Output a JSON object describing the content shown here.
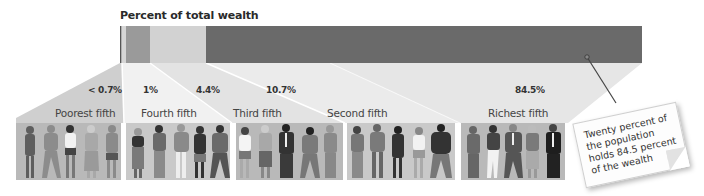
{
  "title": "Percent of total wealth",
  "bar": {
    "segments": [
      {
        "group": "Poorest fifth",
        "share": "< 0.7%",
        "color": "#d6d6d6"
      },
      {
        "group": "Fourth fifth",
        "share": "1%",
        "color": "#9a9a9a"
      },
      {
        "group": "Third fifth",
        "share": "4.4%",
        "color": "#d2d2d2"
      },
      {
        "group": "Second fifth",
        "share": "10.7%",
        "color": "#6a6a6a"
      },
      {
        "group": "Richest fifth",
        "share": "84.5%",
        "color": "#6a6a6a"
      }
    ]
  },
  "percentages": [
    "< 0.7%",
    "1%",
    "4.4%",
    "10.7%",
    "84.5%"
  ],
  "groups": [
    {
      "label": "Poorest fifth"
    },
    {
      "label": "Fourth fifth"
    },
    {
      "label": "Third fifth"
    },
    {
      "label": "Second fifth"
    },
    {
      "label": "Richest fifth"
    }
  ],
  "callout": {
    "text": "Twenty percent of the population holds 84.5 percent of the wealth"
  },
  "colors": {
    "bar_dark": "#6a6a6a",
    "bar_medium": "#9a9a9a",
    "bar_light": "#d2d2d2",
    "fan_a": "#e4e4e4",
    "fan_b": "#ededed",
    "panel_bg": "#b9b9b9"
  }
}
